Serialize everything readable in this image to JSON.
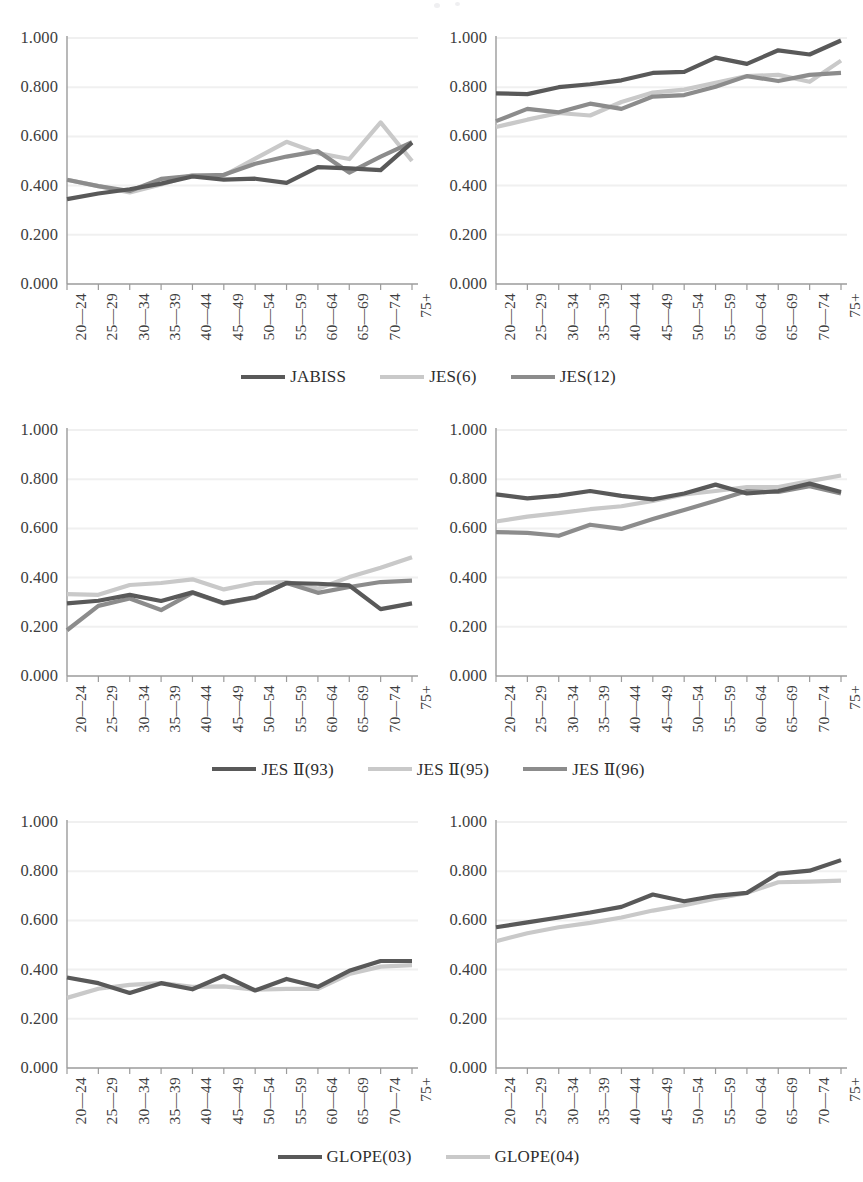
{
  "figure": {
    "type": "multi-panel-line-chart",
    "panel_rows": 3,
    "panel_cols": 2,
    "background": "#ffffff"
  },
  "axis": {
    "y_ticks": [
      "0.000",
      "0.200",
      "0.400",
      "0.600",
      "0.800",
      "1.000"
    ],
    "y_tick_values": [
      0.0,
      0.2,
      0.4,
      0.6,
      0.8,
      1.0
    ],
    "ylim": [
      0,
      1
    ],
    "x_ticks": [
      "20—24",
      "25—29",
      "30—34",
      "35—39",
      "40—44",
      "45—49",
      "50—54",
      "55—59",
      "60—64",
      "65—69",
      "70—74",
      "75+"
    ],
    "grid": "horizontal-light",
    "xlabel": "",
    "ylabel": ""
  },
  "colors": {
    "series_dark": "#595959",
    "series_light": "#c9c9c9",
    "series_mid": "#8c8c8c",
    "axis_line": "#9b9b9b",
    "grid_line": "#f0f0f0",
    "text": "#3d3d3d"
  },
  "legends": [
    {
      "name": "legend-row-1",
      "items": [
        {
          "label": "JABISS",
          "color": "#595959"
        },
        {
          "label": "JES(6)",
          "color": "#c9c9c9"
        },
        {
          "label": "JES(12)",
          "color": "#8c8c8c"
        }
      ]
    },
    {
      "name": "legend-row-2",
      "items": [
        {
          "label": "JES Ⅱ(93)",
          "color": "#595959"
        },
        {
          "label": "JES Ⅱ(95)",
          "color": "#c9c9c9"
        },
        {
          "label": "JES Ⅱ(96)",
          "color": "#8c8c8c"
        }
      ]
    },
    {
      "name": "legend-row-3",
      "items": [
        {
          "label": "GLOPE(03)",
          "color": "#595959"
        },
        {
          "label": "GLOPE(04)",
          "color": "#c9c9c9"
        }
      ]
    }
  ],
  "chart_data": [
    {
      "id": "panel-top-left",
      "type": "line",
      "title": "",
      "xlabel": "",
      "ylabel": "",
      "ylim": [
        0,
        1
      ],
      "grid": true,
      "legend_position": "below-row",
      "categories": [
        "20—24",
        "25—29",
        "30—34",
        "35—39",
        "40—44",
        "45—49",
        "50—54",
        "55—59",
        "60—64",
        "65—69",
        "70—74",
        "75+"
      ],
      "series": [
        {
          "name": "JABISS",
          "color": "#595959",
          "values": [
            0.345,
            0.368,
            0.385,
            0.408,
            0.437,
            0.424,
            0.428,
            0.411,
            0.475,
            0.47,
            0.463,
            0.575
          ]
        },
        {
          "name": "JES(6)",
          "color": "#c9c9c9",
          "values": [
            0.424,
            0.398,
            0.372,
            0.405,
            0.443,
            0.441,
            0.51,
            0.578,
            0.532,
            0.508,
            0.657,
            0.5
          ]
        },
        {
          "name": "JES(12)",
          "color": "#8c8c8c",
          "values": [
            0.424,
            0.398,
            0.378,
            0.427,
            0.44,
            0.444,
            0.489,
            0.518,
            0.54,
            0.453,
            0.518,
            0.577
          ]
        }
      ]
    },
    {
      "id": "panel-top-right",
      "type": "line",
      "title": "",
      "xlabel": "",
      "ylabel": "",
      "ylim": [
        0,
        1
      ],
      "grid": true,
      "legend_position": "below-row",
      "categories": [
        "20—24",
        "25—29",
        "30—34",
        "35—39",
        "40—44",
        "45—49",
        "50—54",
        "55—59",
        "60—64",
        "65—69",
        "70—74",
        "75+"
      ],
      "series": [
        {
          "name": "JABISS",
          "color": "#595959",
          "values": [
            0.775,
            0.772,
            0.8,
            0.812,
            0.828,
            0.858,
            0.862,
            0.92,
            0.895,
            0.95,
            0.933,
            0.99
          ]
        },
        {
          "name": "JES(6)",
          "color": "#c9c9c9",
          "values": [
            0.638,
            0.668,
            0.695,
            0.685,
            0.74,
            0.778,
            0.79,
            0.818,
            0.845,
            0.85,
            0.822,
            0.908
          ]
        },
        {
          "name": "JES(12)",
          "color": "#8c8c8c",
          "values": [
            0.662,
            0.712,
            0.698,
            0.733,
            0.712,
            0.762,
            0.768,
            0.802,
            0.845,
            0.825,
            0.85,
            0.858
          ]
        }
      ]
    },
    {
      "id": "panel-middle-left",
      "type": "line",
      "title": "",
      "xlabel": "",
      "ylabel": "",
      "ylim": [
        0,
        1
      ],
      "grid": true,
      "legend_position": "below-row",
      "categories": [
        "20—24",
        "25—29",
        "30—34",
        "35—39",
        "40—44",
        "45—49",
        "50—54",
        "55—59",
        "60—64",
        "65—69",
        "70—74",
        "75+"
      ],
      "series": [
        {
          "name": "JES Ⅱ(93)",
          "color": "#595959",
          "values": [
            0.295,
            0.306,
            0.33,
            0.305,
            0.34,
            0.297,
            0.32,
            0.378,
            0.375,
            0.368,
            0.272,
            0.295
          ]
        },
        {
          "name": "JES Ⅱ(95)",
          "color": "#c9c9c9",
          "values": [
            0.333,
            0.33,
            0.37,
            0.378,
            0.393,
            0.352,
            0.378,
            0.382,
            0.355,
            0.402,
            0.44,
            0.483
          ]
        },
        {
          "name": "JES Ⅱ(96)",
          "color": "#8c8c8c",
          "values": [
            0.186,
            0.285,
            0.315,
            0.268,
            0.338,
            0.295,
            0.318,
            0.378,
            0.338,
            0.362,
            0.382,
            0.388
          ]
        }
      ]
    },
    {
      "id": "panel-middle-right",
      "type": "line",
      "title": "",
      "xlabel": "",
      "ylabel": "",
      "ylim": [
        0,
        1
      ],
      "grid": true,
      "legend_position": "below-row",
      "categories": [
        "20—24",
        "25—29",
        "30—34",
        "35—39",
        "40—44",
        "45—49",
        "50—54",
        "55—59",
        "60—64",
        "65—69",
        "70—74",
        "75+"
      ],
      "series": [
        {
          "name": "JES Ⅱ(93)",
          "color": "#595959",
          "values": [
            0.738,
            0.722,
            0.733,
            0.752,
            0.732,
            0.718,
            0.742,
            0.778,
            0.742,
            0.752,
            0.782,
            0.748
          ]
        },
        {
          "name": "JES Ⅱ(95)",
          "color": "#c9c9c9",
          "values": [
            0.628,
            0.648,
            0.662,
            0.678,
            0.69,
            0.712,
            0.738,
            0.752,
            0.768,
            0.768,
            0.792,
            0.815
          ]
        },
        {
          "name": "JES Ⅱ(96)",
          "color": "#8c8c8c",
          "values": [
            0.585,
            0.582,
            0.57,
            0.615,
            0.598,
            0.638,
            0.675,
            0.712,
            0.752,
            0.748,
            0.772,
            0.742
          ]
        }
      ]
    },
    {
      "id": "panel-bottom-left",
      "type": "line",
      "title": "",
      "xlabel": "",
      "ylabel": "",
      "ylim": [
        0,
        1
      ],
      "grid": true,
      "legend_position": "below-row",
      "categories": [
        "20—24",
        "25—29",
        "30—34",
        "35—39",
        "40—44",
        "45—49",
        "50—54",
        "55—59",
        "60—64",
        "65—69",
        "70—74",
        "75+"
      ],
      "series": [
        {
          "name": "GLOPE(03)",
          "color": "#595959",
          "values": [
            0.368,
            0.345,
            0.305,
            0.345,
            0.32,
            0.375,
            0.315,
            0.362,
            0.33,
            0.395,
            0.435,
            0.435
          ]
        },
        {
          "name": "GLOPE(04)",
          "color": "#c9c9c9",
          "values": [
            0.285,
            0.322,
            0.338,
            0.345,
            0.33,
            0.332,
            0.318,
            0.322,
            0.322,
            0.382,
            0.412,
            0.418
          ]
        }
      ]
    },
    {
      "id": "panel-bottom-right",
      "type": "line",
      "title": "",
      "xlabel": "",
      "ylabel": "",
      "ylim": [
        0,
        1
      ],
      "grid": true,
      "legend_position": "below-row",
      "categories": [
        "20—24",
        "25—29",
        "30—34",
        "35—39",
        "40—44",
        "45—49",
        "50—54",
        "55—59",
        "60—64",
        "65—69",
        "70—74",
        "75+"
      ],
      "series": [
        {
          "name": "GLOPE(03)",
          "color": "#595959",
          "values": [
            0.572,
            0.592,
            0.612,
            0.632,
            0.655,
            0.705,
            0.678,
            0.7,
            0.712,
            0.79,
            0.802,
            0.845
          ]
        },
        {
          "name": "GLOPE(04)",
          "color": "#c9c9c9",
          "values": [
            0.515,
            0.548,
            0.572,
            0.59,
            0.612,
            0.64,
            0.662,
            0.688,
            0.712,
            0.755,
            0.758,
            0.762
          ]
        }
      ]
    }
  ]
}
